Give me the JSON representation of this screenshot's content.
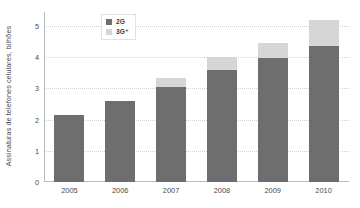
{
  "chart_data": {
    "type": "bar",
    "subtype": "stacked-bar",
    "title": "",
    "xlabel": "",
    "ylabel": "Assinaturas de telefones celulares, bilhões",
    "categories": [
      "2005",
      "2006",
      "2007",
      "2008",
      "2009",
      "2010"
    ],
    "series": [
      {
        "name": "2G",
        "color": "#6e6e6e",
        "values": [
          2.15,
          2.6,
          3.05,
          3.58,
          3.97,
          4.35
        ]
      },
      {
        "name": "3G⁺",
        "color": "#d6d6d6",
        "values": [
          0,
          0,
          0.3,
          0.42,
          0.5,
          0.85
        ]
      }
    ],
    "totals": [
      2.15,
      2.6,
      3.35,
      4.0,
      4.47,
      5.2
    ],
    "ylim": [
      0,
      5.45
    ],
    "yticks": [
      "0",
      "1",
      "2",
      "3",
      "4",
      "5"
    ],
    "ytick_values": [
      0,
      1,
      2,
      3,
      4,
      5
    ],
    "grid": true,
    "grid_style": "dotted",
    "legend_position": "top-center"
  },
  "legend": {
    "items": [
      {
        "label": "2G",
        "swatch": "dark-gray-swatch"
      },
      {
        "label": "3G⁺",
        "swatch": "light-gray-swatch"
      }
    ]
  },
  "colors": {
    "series_2g": "#6e6e6e",
    "series_3g": "#d6d6d6",
    "axis": "#b9b9b9",
    "grid": "#d2d2d2",
    "text": "#4a4a4a",
    "background": "#ffffff"
  }
}
